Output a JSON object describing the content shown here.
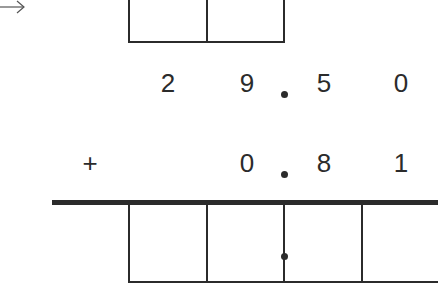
{
  "arrow": {
    "icon": "arrow-right-icon",
    "glyph": "→"
  },
  "top_boxes": {
    "count": 2
  },
  "row1": {
    "digits": [
      "2",
      "9",
      "5",
      "0"
    ],
    "decimal_point": "."
  },
  "row2": {
    "operator": "+",
    "digits": [
      "0",
      "8",
      "1"
    ],
    "decimal_point": "."
  },
  "answer_boxes": {
    "count": 4,
    "decimal_marker": "dot"
  },
  "colors": {
    "ink": "#2b2b2b",
    "background": "#ffffff"
  }
}
